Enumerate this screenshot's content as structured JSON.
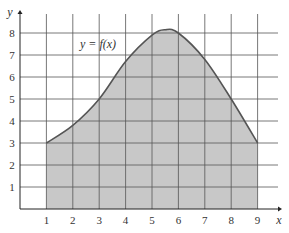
{
  "chart_data": {
    "type": "area",
    "title": "",
    "xlabel": "x",
    "ylabel": "y",
    "annotation": "y = f(x)",
    "xlim": [
      0,
      9
    ],
    "ylim": [
      0,
      8
    ],
    "x_ticks": [
      "1",
      "2",
      "3",
      "4",
      "5",
      "6",
      "7",
      "8",
      "9"
    ],
    "y_ticks": [
      "1",
      "2",
      "3",
      "4",
      "5",
      "6",
      "7",
      "8"
    ],
    "grid": true,
    "shaded_region": {
      "x_from": 1,
      "x_to": 9
    },
    "x": [
      1,
      2,
      3,
      4,
      5,
      5.5,
      6,
      7,
      8,
      9
    ],
    "series": [
      {
        "name": "f(x)",
        "values": [
          3,
          3.8,
          5,
          6.7,
          7.9,
          8.15,
          8,
          6.8,
          5,
          3
        ]
      }
    ],
    "colors": {
      "fill": "#c8c8c8",
      "curve": "#555555",
      "grid": "#555555"
    }
  }
}
